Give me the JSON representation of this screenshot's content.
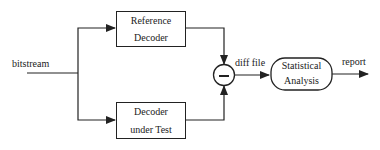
{
  "diagram": {
    "type": "block-diagram",
    "input": {
      "label": "bitstream"
    },
    "blocks": [
      {
        "id": "ref",
        "line1": "Reference",
        "line2": "Decoder"
      },
      {
        "id": "dut",
        "line1": "Decoder",
        "line2": "under Test"
      }
    ],
    "subtractor": {
      "symbol": "−"
    },
    "edge_labels": {
      "diff": "diff file",
      "report": "report"
    },
    "analysis": {
      "line1": "Statistical",
      "line2": "Analysis"
    },
    "edges": [
      {
        "from": "bitstream",
        "to": "Reference Decoder"
      },
      {
        "from": "bitstream",
        "to": "Decoder under Test"
      },
      {
        "from": "Reference Decoder",
        "to": "subtractor"
      },
      {
        "from": "Decoder under Test",
        "to": "subtractor"
      },
      {
        "from": "subtractor",
        "to": "Statistical Analysis",
        "label": "diff file"
      },
      {
        "from": "Statistical Analysis",
        "to": "output",
        "label": "report"
      }
    ]
  }
}
